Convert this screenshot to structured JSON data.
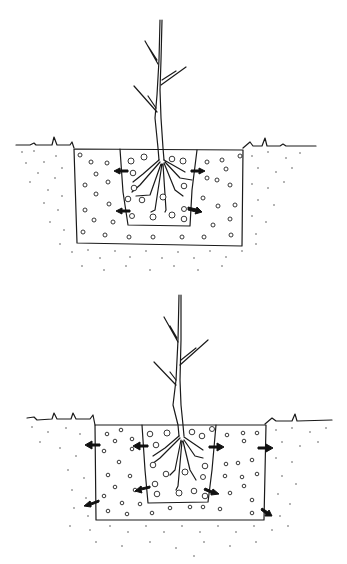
{
  "figure": {
    "background": "#ffffff",
    "ink_color": "#1a1a1a",
    "panels": [
      {
        "name": "small-hole",
        "ground_y": 146,
        "outer_hole": {
          "x1": 73,
          "y1": 149,
          "x2": 243,
          "y2": 246
        },
        "inner_rootball": {
          "x1": 120,
          "y1": 149,
          "x2": 197,
          "y2": 225
        },
        "stem": {
          "x": 160,
          "top_y": 20,
          "bottom_y": 158
        },
        "arrows": [
          {
            "x": 128,
            "y": 171,
            "dir": "left"
          },
          {
            "x": 190,
            "y": 171,
            "dir": "right"
          },
          {
            "x": 130,
            "y": 211,
            "dir": "left"
          },
          {
            "x": 188,
            "y": 209,
            "dir": "right-down"
          }
        ]
      },
      {
        "name": "large-hole",
        "ground_y": 419,
        "outer_hole": {
          "x1": 95,
          "y1": 425,
          "x2": 265,
          "y2": 520
        },
        "inner_rootball": {
          "x1": 142,
          "y1": 425,
          "x2": 215,
          "y2": 503
        },
        "stem": {
          "x": 180,
          "top_y": 295,
          "bottom_y": 436
        },
        "arrows": [
          {
            "x": 99,
            "y": 445,
            "dir": "left"
          },
          {
            "x": 147,
            "y": 446,
            "dir": "left"
          },
          {
            "x": 210,
            "y": 447,
            "dir": "right"
          },
          {
            "x": 260,
            "y": 448,
            "dir": "right"
          },
          {
            "x": 148,
            "y": 488,
            "dir": "left-down"
          },
          {
            "x": 207,
            "y": 490,
            "dir": "right-down"
          },
          {
            "x": 97,
            "y": 502,
            "dir": "left-down"
          },
          {
            "x": 263,
            "y": 510,
            "dir": "right-down"
          }
        ]
      }
    ]
  }
}
